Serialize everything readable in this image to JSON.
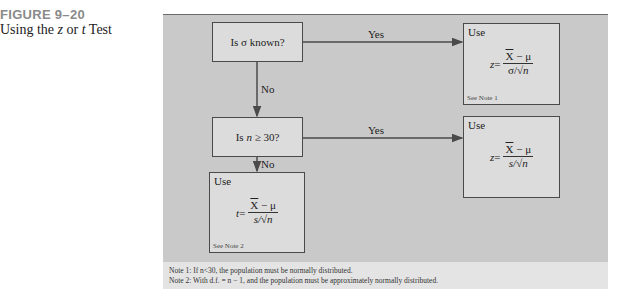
{
  "figure": {
    "label": "FIGURE 9–20",
    "title_pre": "Using the ",
    "title_z": "z",
    "title_mid": " or ",
    "title_t": "t",
    "title_post": " Test"
  },
  "flowchart": {
    "decision1": "Is σ known?",
    "decision2_pre": "Is ",
    "decision2_n": "n",
    "decision2_post": " ≥ 30?",
    "yes_label_1": "Yes",
    "no_label_1": "No",
    "yes_label_2": "Yes",
    "no_label_2": "No",
    "result_z_sigma": {
      "use": "Use",
      "var": "z",
      "eq": " = ",
      "numerator_xbar": "X",
      "numerator_rest": " − μ",
      "denominator_pre": "σ/",
      "denominator_sqrt": "n",
      "note": "See Note 1"
    },
    "result_z_s": {
      "use": "Use",
      "var": "z",
      "eq": " = ",
      "numerator_xbar": "X",
      "numerator_rest": " − μ",
      "denominator_pre": "s/",
      "denominator_sqrt": "n"
    },
    "result_t": {
      "use": "Use",
      "var": "t",
      "eq": " = ",
      "numerator_xbar": "X",
      "numerator_rest": " − μ",
      "denominator_pre": "s/",
      "denominator_sqrt": "n",
      "note": "See Note 2"
    }
  },
  "notes": {
    "note1": "Note 1: If n<30, the population must be normally distributed.",
    "note2": "Note 2: With d.f. = n − 1, and the population must be approximately normally distributed."
  },
  "colors": {
    "panel": "#c9c9c9",
    "box": "#dcdcdc",
    "notes_strip": "#e4e4e4",
    "line": "#4a4a4a"
  }
}
